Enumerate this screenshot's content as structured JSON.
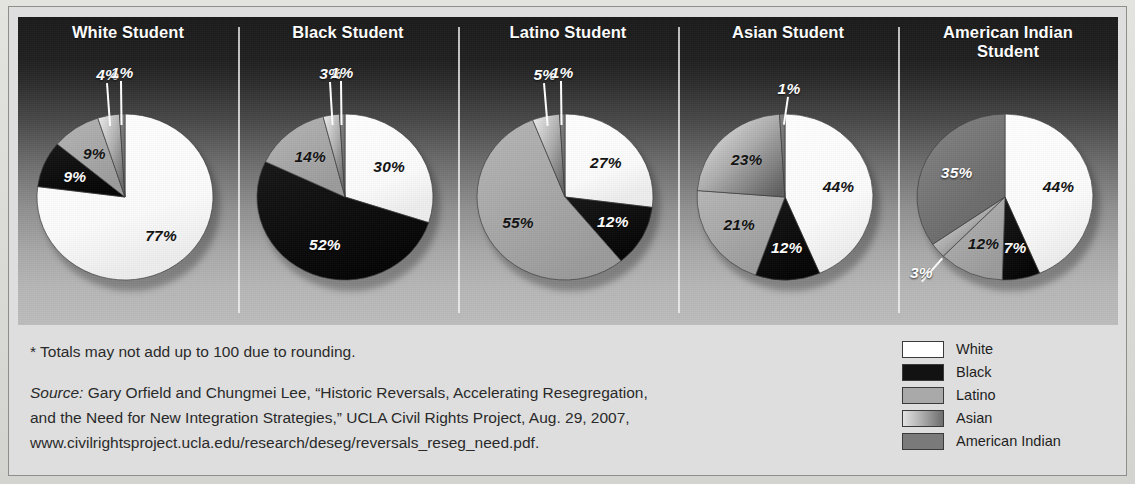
{
  "chart_data": {
    "type": "pie",
    "title": "",
    "note": "* Totals may not add up to 100 due to rounding.",
    "legend_position": "bottom-right",
    "categories": [
      "White",
      "Black",
      "Latino",
      "Asian",
      "American Indian"
    ],
    "colors": {
      "White": "#ffffff",
      "Black": "#121212",
      "Latino": "#a9a9a9",
      "Asian": "#c9c9c9",
      "American Indian": "#7a7a7a"
    },
    "charts": [
      {
        "title": "White Student",
        "title_line2": "",
        "values": [
          77,
          9,
          9,
          4,
          1
        ],
        "labels": [
          "77%",
          "9%",
          "9%",
          "4%",
          "1%"
        ]
      },
      {
        "title": "Black Student",
        "title_line2": "",
        "values": [
          30,
          52,
          14,
          3,
          1
        ],
        "labels": [
          "30%",
          "52%",
          "14%",
          "3%",
          "1%"
        ]
      },
      {
        "title": "Latino Student",
        "title_line2": "",
        "values": [
          27,
          12,
          55,
          5,
          1
        ],
        "labels": [
          "27%",
          "12%",
          "55%",
          "5%",
          "1%"
        ]
      },
      {
        "title": "Asian Student",
        "title_line2": "",
        "values": [
          44,
          12,
          21,
          23,
          1
        ],
        "labels": [
          "44%",
          "12%",
          "21%",
          "23%",
          "1%"
        ]
      },
      {
        "title": "American Indian",
        "title_line2": "Student",
        "values": [
          44,
          7,
          12,
          3,
          35
        ],
        "labels": [
          "44%",
          "7%",
          "12%",
          "3%",
          "35%"
        ]
      }
    ]
  },
  "panels": [
    {
      "title": "White Student",
      "title2": ""
    },
    {
      "title": "Black Student",
      "title2": ""
    },
    {
      "title": "Latino Student",
      "title2": ""
    },
    {
      "title": "Asian Student",
      "title2": ""
    },
    {
      "title": "American Indian",
      "title2": "Student"
    }
  ],
  "footer": {
    "note": "* Totals may not add up to 100 due to rounding.",
    "source_word": "Source:",
    "source_line1": " Gary Orfield and Chungmei Lee, “Historic Reversals, Accelerating Resegregation,",
    "source_line2": "and the Need for New Integration Strategies,” UCLA Civil Rights Project, Aug. 29, 2007,",
    "source_line3": "www.civilrightsproject.ucla.edu/research/deseg/reversals_reseg_need.pdf."
  },
  "legend": {
    "items": [
      {
        "label": "White"
      },
      {
        "label": "Black"
      },
      {
        "label": "Latino"
      },
      {
        "label": "American Indian"
      },
      {
        "label": "Asian"
      }
    ],
    "ordered": [
      {
        "label": "White",
        "swatch": "sw-white"
      },
      {
        "label": "Black",
        "swatch": "sw-black"
      },
      {
        "label": "Latino",
        "swatch": "sw-latino"
      },
      {
        "label": "Asian",
        "swatch": "sw-asian"
      },
      {
        "label": "American Indian",
        "swatch": "sw-amind"
      }
    ]
  }
}
